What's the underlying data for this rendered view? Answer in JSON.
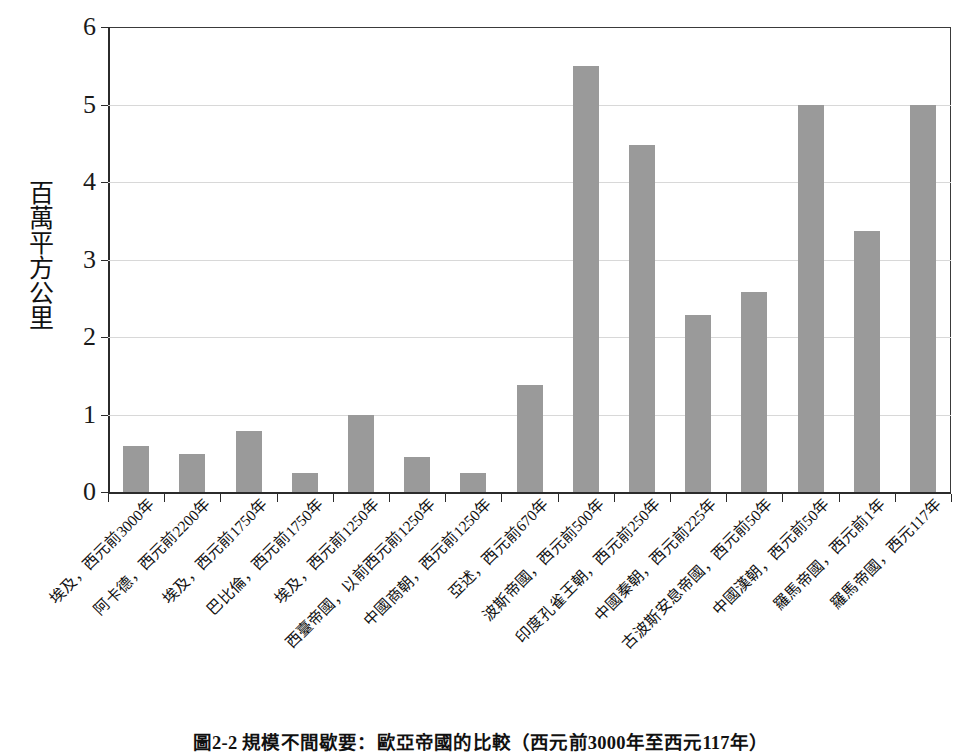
{
  "chart_data": {
    "type": "bar",
    "title": "",
    "caption": "圖2-2 規模不間歇要：歐亞帝國的比較（西元前3000年至西元117年）",
    "xlabel": "",
    "ylabel": "百萬平方公里",
    "ylim": [
      0,
      6
    ],
    "yticks": [
      0,
      1,
      2,
      3,
      4,
      5,
      6
    ],
    "ytick_labels": [
      "0",
      "1",
      "2",
      "3",
      "4",
      "5",
      "6"
    ],
    "grid": true,
    "legend": "none",
    "bar_color": "#9a9a9a",
    "categories": [
      "埃及，西元前3000年",
      "阿卡德，西元前2200年",
      "埃及，西元前1750年",
      "巴比倫，西元前1750年",
      "埃及，西元前1250年",
      "西臺帝國，以前西元前1250年",
      "中國商朝，西元前1250年",
      "亞述，西元前670年",
      "波斯帝國，西元前500年",
      "印度孔雀王朝，西元前250年",
      "中國秦朝，西元前225年",
      "古波斯安息帝國，西元前50年",
      "中國漢朝，西元前50年",
      "羅馬帝國，西元前1年",
      "羅馬帝國，西元117年"
    ],
    "values": [
      0.6,
      0.49,
      0.79,
      0.25,
      0.99,
      0.45,
      0.24,
      1.38,
      5.5,
      4.48,
      2.28,
      2.58,
      5.0,
      3.37,
      4.99
    ]
  }
}
